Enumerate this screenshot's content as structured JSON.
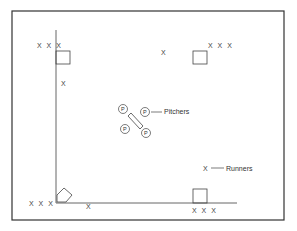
{
  "diagram": {
    "title": "",
    "legend": {
      "pitchers_label": "Pitchers",
      "runners_label": "Runners",
      "runner_symbol": "X",
      "pitcher_symbol": "P"
    },
    "runner_groups": {
      "top_left": "X X X",
      "top_right": "X X X",
      "bottom_left": "X X X",
      "bottom_right": "X X X"
    },
    "single_runners": {
      "left_line": "X",
      "top_center": "X",
      "bottom_line": "X",
      "legend": "X"
    },
    "pitchers": [
      "P",
      "P",
      "P",
      "P"
    ],
    "colors": {
      "line": "#444444",
      "frame": "#333333",
      "background": "#ffffff"
    }
  }
}
